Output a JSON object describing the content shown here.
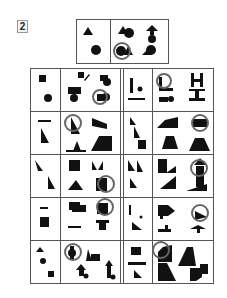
{
  "puzzle": {
    "number_label": "2",
    "colors": {
      "shape": "#111111",
      "ring": "#666666",
      "line": "#555555"
    },
    "reference_panel": {
      "cells": [
        {
          "shapes": [
            "triangle",
            "circle"
          ]
        },
        {
          "shapes": [
            "triangle+circle",
            "arrow+circle",
            "circle+triangle (ringed)",
            "triangle+circle"
          ]
        }
      ]
    },
    "grid": {
      "rows": 5,
      "columns": [
        "single",
        "double",
        "single",
        "double"
      ],
      "ringed_count": 10
    }
  }
}
